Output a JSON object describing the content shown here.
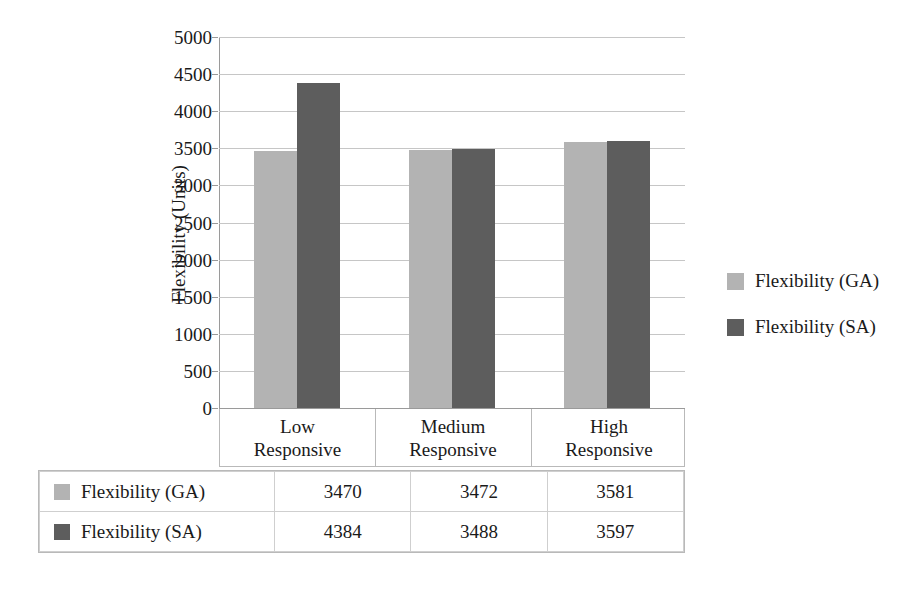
{
  "chart_data": {
    "type": "bar",
    "title": "",
    "xlabel": "",
    "ylabel": "Flexibility (Units)",
    "categories": [
      "Low\nResponsive",
      "Medium\nResponsive",
      "High\nResponsive"
    ],
    "category_lines": [
      [
        "Low",
        "Responsive"
      ],
      [
        "Medium",
        "Responsive"
      ],
      [
        "High",
        "Responsive"
      ]
    ],
    "series": [
      {
        "name": "Flexibility (GA)",
        "values": [
          3470,
          3472,
          3581
        ],
        "color": "#b3b3b3"
      },
      {
        "name": "Flexibility (SA)",
        "values": [
          4384,
          3488,
          3597
        ],
        "color": "#5d5d5d"
      }
    ],
    "ylim": [
      0,
      5000
    ],
    "ytick_step": 500,
    "yticks": [
      5000,
      4500,
      4000,
      3500,
      3000,
      2500,
      2000,
      1500,
      1000,
      500,
      0
    ],
    "ytick_labels": [
      "5000",
      "4500",
      "4000",
      "3500",
      "3000",
      "2500",
      "2000",
      "1500",
      "1000",
      "500",
      "0"
    ],
    "grid": true,
    "legend_position": "right"
  },
  "legend": {
    "entries": [
      {
        "label": "Flexibility (GA)",
        "color": "#b3b3b3"
      },
      {
        "label": "Flexibility (SA)",
        "color": "#5d5d5d"
      }
    ]
  },
  "data_table": {
    "rows": [
      {
        "label": "Flexibility (GA)",
        "color": "#b3b3b3",
        "cells": [
          "3470",
          "3472",
          "3581"
        ]
      },
      {
        "label": "Flexibility (SA)",
        "color": "#5d5d5d",
        "cells": [
          "4384",
          "3488",
          "3597"
        ]
      }
    ]
  }
}
